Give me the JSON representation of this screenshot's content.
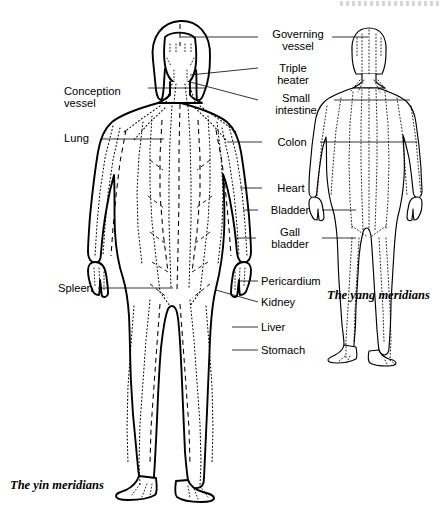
{
  "page": {
    "width": 442,
    "height": 510,
    "background": "#ffffff",
    "ink": "#000000"
  },
  "captions": {
    "yin": "The yin meridians",
    "yang": "The yang meridians"
  },
  "figures": [
    {
      "id": "yin-figure",
      "name": "main-body-figure-yin",
      "description": "Large front-facing female body outline with dotted and dashed yin meridian pathways"
    },
    {
      "id": "yang-figure",
      "name": "small-body-figure-yang",
      "description": "Smaller rear-facing female body outline with dotted yang meridian pathways"
    }
  ],
  "labels_left": [
    {
      "id": "conception-vessel",
      "text": "Conception\nvessel",
      "x": 64,
      "y": 85,
      "w": 82,
      "align": "left"
    },
    {
      "id": "lung",
      "text": "Lung",
      "x": 64,
      "y": 132,
      "w": 82,
      "align": "left"
    },
    {
      "id": "spleen",
      "text": "Spleen",
      "x": 58,
      "y": 282,
      "w": 88,
      "align": "left"
    }
  ],
  "labels_right": [
    {
      "id": "governing-vessel",
      "text": "Governing\nvessel",
      "x": 261,
      "y": 28,
      "w": 74,
      "align": "center"
    },
    {
      "id": "triple-heater",
      "text": "Triple\nheater",
      "x": 263,
      "y": 62,
      "w": 60,
      "align": "center"
    },
    {
      "id": "small-intestine",
      "text": "Small\nintestine",
      "x": 261,
      "y": 92,
      "w": 70,
      "align": "center"
    },
    {
      "id": "colon",
      "text": "Colon",
      "x": 268,
      "y": 138,
      "w": 48,
      "align": "center"
    },
    {
      "id": "heart",
      "text": "Heart",
      "x": 268,
      "y": 182,
      "w": 46,
      "align": "center"
    },
    {
      "id": "bladder",
      "text": "Bladder",
      "x": 262,
      "y": 203,
      "w": 56,
      "align": "center"
    },
    {
      "id": "gall-bladder",
      "text": "Gall\nbladder",
      "x": 261,
      "y": 225,
      "w": 58,
      "align": "center"
    },
    {
      "id": "pericardium",
      "text": "Pericardium",
      "x": 261,
      "y": 274,
      "w": 78,
      "align": "left"
    },
    {
      "id": "kidney",
      "text": "Kidney",
      "x": 261,
      "y": 296,
      "w": 60,
      "align": "left"
    },
    {
      "id": "liver",
      "text": "Liver",
      "x": 261,
      "y": 320,
      "w": 50,
      "align": "left"
    },
    {
      "id": "stomach",
      "text": "Stomach",
      "x": 261,
      "y": 343,
      "w": 66,
      "align": "left"
    }
  ],
  "meridian_style": {
    "outline_stroke": "#000000",
    "outline_width_main": 1.9,
    "outline_width_small": 1.1,
    "dotted_pattern": "1,2.6",
    "dashed_pattern": "5,4",
    "leader_width": 0.8
  }
}
